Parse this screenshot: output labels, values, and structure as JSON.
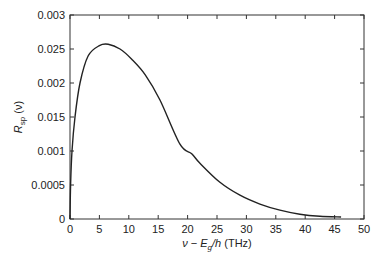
{
  "chart_data": {
    "type": "line",
    "title": "",
    "xlabel": "ν − E_g/h (THz)",
    "xlabel_parts": {
      "nu": "ν",
      "minus": " − ",
      "E": "E",
      "sub": "g",
      "rest": "/h",
      "unit": " (THz)"
    },
    "ylabel": "R_sp (ν)",
    "ylabel_parts": {
      "R": "R",
      "sub": "sp",
      "rest": " (ν)"
    },
    "xlim": [
      0,
      50
    ],
    "ylim": [
      0,
      0.003
    ],
    "x_ticks": [
      0,
      5,
      10,
      15,
      20,
      25,
      30,
      35,
      40,
      45,
      50
    ],
    "x_tick_labels": [
      "0",
      "5",
      "10",
      "15",
      "20",
      "25",
      "30",
      "35",
      "40",
      "45",
      "50"
    ],
    "y_ticks": [
      0,
      0.0005,
      0.001,
      0.0015,
      0.002,
      0.0025,
      0.003
    ],
    "y_tick_labels": [
      "0",
      "0.0005",
      "0.001",
      "0.015",
      "0.002",
      "0.025",
      "0.003"
    ],
    "grid": false,
    "legend": null,
    "series": [
      {
        "name": "R_sp(ν)",
        "color": "#222222",
        "x": [
          0,
          0.1,
          0.34,
          0.85,
          1.7,
          3.1,
          5.0,
          6.5,
          8.5,
          10.5,
          12.8,
          15.3,
          18.7,
          20.7,
          22.1,
          25.5,
          28.9,
          32.3,
          35.7,
          39.1,
          42.5,
          46.1
        ],
        "y": [
          0,
          0.0005,
          0.001,
          0.0015,
          0.002,
          0.0024,
          0.00255,
          0.00257,
          0.0025,
          0.00235,
          0.00212,
          0.00175,
          0.0011,
          0.00096,
          0.00082,
          0.00054,
          0.00035,
          0.00022,
          0.00013,
          7e-05,
          4e-05,
          3e-05
        ]
      }
    ]
  }
}
